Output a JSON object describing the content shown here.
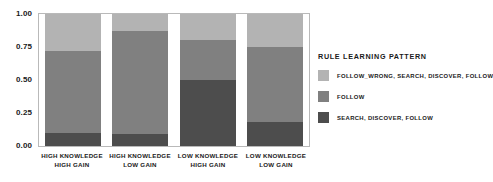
{
  "chart_data": {
    "type": "bar",
    "subtype": "stacked-proportional",
    "title": "",
    "xlabel": "",
    "ylabel": "",
    "ylim": [
      0,
      1
    ],
    "yticks": [
      "0.00",
      "0.25",
      "0.50",
      "0.75",
      "1.00"
    ],
    "ytick_values": [
      0.0,
      0.25,
      0.5,
      0.75,
      1.0
    ],
    "grid": false,
    "legend_position": "right",
    "legend_title": "RULE LEARNING PATTERN",
    "categories": [
      "HIGH KNOWLEDGE HIGH GAIN",
      "HIGH KNOWLEDGE LOW GAIN",
      "LOW KNOWLEDGE HIGH GAIN",
      "LOW KNOWLEDGE LOW GAIN"
    ],
    "category_lines": [
      [
        "HIGH KNOWLEDGE",
        "HIGH GAIN"
      ],
      [
        "HIGH KNOWLEDGE",
        "LOW GAIN"
      ],
      [
        "LOW KNOWLEDGE",
        "HIGH GAIN"
      ],
      [
        "LOW KNOWLEDGE",
        "LOW GAIN"
      ]
    ],
    "series": [
      {
        "name": "SEARCH, DISCOVER, FOLLOW",
        "color": "#4d4d4d",
        "values": [
          0.1,
          0.09,
          0.5,
          0.18
        ]
      },
      {
        "name": "FOLLOW",
        "color": "#808080",
        "values": [
          0.62,
          0.78,
          0.3,
          0.57
        ]
      },
      {
        "name": "FOLLOW_WRONG, SEARCH, DISCOVER, FOLLOW",
        "color": "#b3b3b3",
        "values": [
          0.28,
          0.13,
          0.2,
          0.25
        ]
      }
    ],
    "cumulative_tops": [
      [
        0.1,
        0.72,
        1.0
      ],
      [
        0.09,
        0.87,
        1.0
      ],
      [
        0.5,
        0.8,
        1.0
      ],
      [
        0.18,
        0.75,
        1.0
      ]
    ]
  },
  "legend": {
    "title": "RULE LEARNING PATTERN",
    "items": [
      {
        "label": "FOLLOW_WRONG, SEARCH, DISCOVER, FOLLOW",
        "color": "#b3b3b3"
      },
      {
        "label": "FOLLOW",
        "color": "#808080"
      },
      {
        "label": "SEARCH, DISCOVER, FOLLOW",
        "color": "#4d4d4d"
      }
    ]
  },
  "axis": {
    "y_ticks": [
      "1.00",
      "0.75",
      "0.50",
      "0.25",
      "0.00"
    ]
  },
  "x_labels": [
    {
      "line1": "HIGH KNOWLEDGE",
      "line2": "HIGH GAIN"
    },
    {
      "line1": "HIGH KNOWLEDGE",
      "line2": "LOW GAIN"
    },
    {
      "line1": "LOW KNOWLEDGE",
      "line2": "HIGH GAIN"
    },
    {
      "line1": "LOW KNOWLEDGE",
      "line2": "LOW GAIN"
    }
  ]
}
